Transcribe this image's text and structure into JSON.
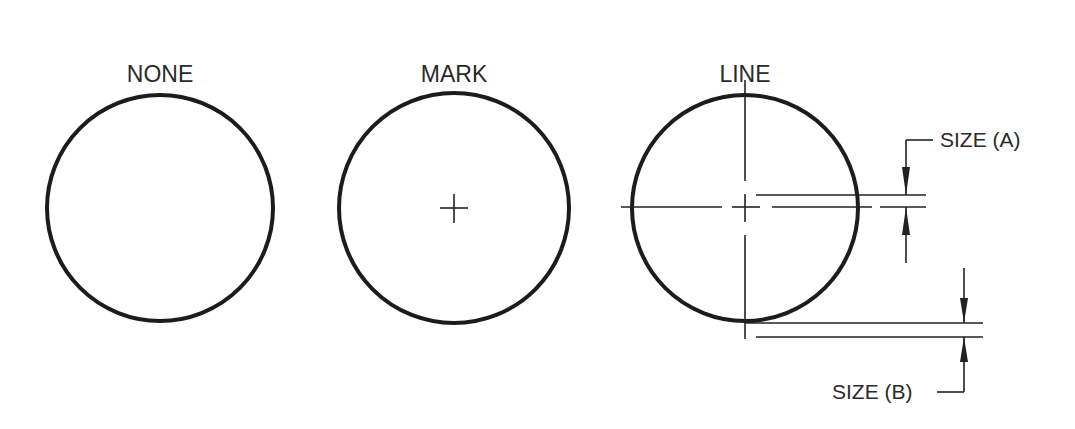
{
  "diagram": {
    "panels": [
      {
        "label": "NONE",
        "center_style": "none"
      },
      {
        "label": "MARK",
        "center_style": "mark"
      },
      {
        "label": "LINE",
        "center_style": "line"
      }
    ],
    "dimensions": {
      "size_a": "SIZE (A)",
      "size_b": "SIZE (B)"
    }
  }
}
